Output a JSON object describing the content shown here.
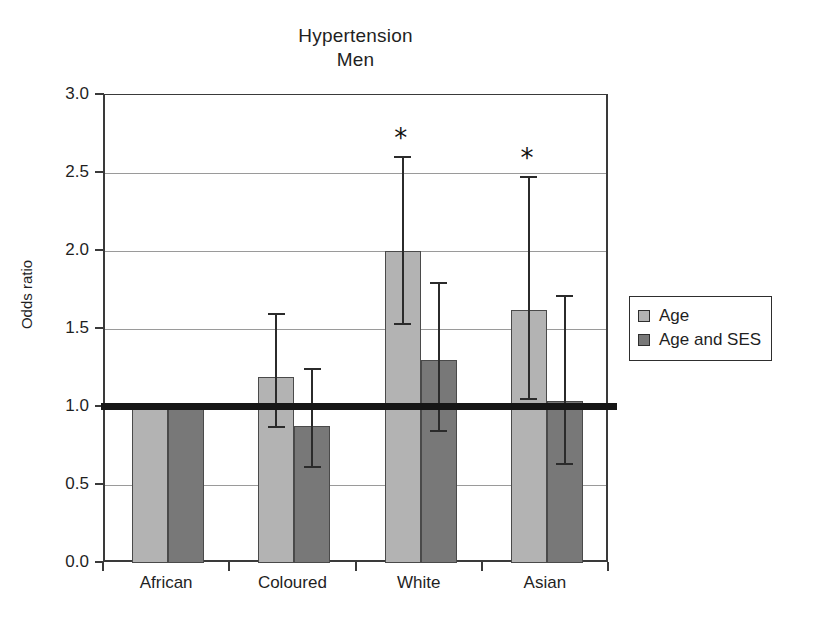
{
  "chart_data": {
    "type": "bar",
    "title": "Hypertension",
    "subtitle": "Men",
    "xlabel": "",
    "ylabel": "Odds ratio",
    "ylim": [
      0.0,
      3.0
    ],
    "ytick_labels": [
      "0.0",
      "0.5",
      "1.0",
      "1.5",
      "2.0",
      "2.5",
      "3.0"
    ],
    "ytick_values": [
      0.0,
      0.5,
      1.0,
      1.5,
      2.0,
      2.5,
      3.0
    ],
    "grid": true,
    "grid_axis": "y",
    "legend_position": "right",
    "reference_line": 1.0,
    "significance_marker": "*",
    "categories": [
      "African",
      "Coloured",
      "White",
      "Asian"
    ],
    "series": [
      {
        "name": "Age",
        "color": "#b3b3b3",
        "values": [
          1.0,
          1.19,
          2.0,
          1.62
        ],
        "ci_low": [
          null,
          0.88,
          1.54,
          1.06
        ],
        "ci_high": [
          null,
          1.6,
          2.61,
          2.48
        ],
        "significant": [
          false,
          false,
          true,
          true
        ]
      },
      {
        "name": "Age and SES",
        "color": "#787878",
        "values": [
          1.0,
          0.88,
          1.3,
          1.04
        ],
        "ci_low": [
          null,
          0.62,
          0.85,
          0.64
        ],
        "ci_high": [
          null,
          1.25,
          1.8,
          1.72
        ],
        "significant": [
          false,
          false,
          false,
          false
        ]
      }
    ]
  },
  "legend": {
    "items": [
      {
        "label": "Age",
        "swatch": "series-age"
      },
      {
        "label": "Age and SES",
        "swatch": "series-age-ses"
      }
    ]
  }
}
